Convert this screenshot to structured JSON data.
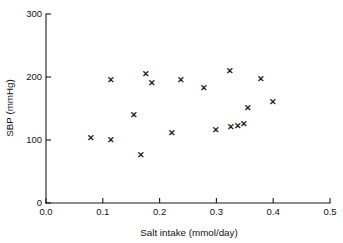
{
  "chart_data": {
    "type": "scatter",
    "title": "",
    "xlabel": "Salt intake  (mmol/day)",
    "ylabel": "SBP (mmHg)",
    "xlim": [
      0.0,
      0.5
    ],
    "ylim": [
      0,
      300
    ],
    "xticks": [
      "0.0",
      "0.1",
      "0.2",
      "0.3",
      "0.4",
      "0.5"
    ],
    "xtick_values": [
      0.0,
      0.1,
      0.2,
      0.3,
      0.4,
      0.5
    ],
    "yticks": [
      "0",
      "100",
      "200",
      "300"
    ],
    "ytick_values": [
      0,
      100,
      200,
      300
    ],
    "grid": false,
    "legend": "none",
    "marker": "x",
    "marker_color": "#1a1a1a",
    "series": [
      {
        "name": "subjects",
        "points": [
          {
            "x": 0.079,
            "y": 103
          },
          {
            "x": 0.114,
            "y": 195
          },
          {
            "x": 0.114,
            "y": 100
          },
          {
            "x": 0.155,
            "y": 140
          },
          {
            "x": 0.167,
            "y": 76
          },
          {
            "x": 0.176,
            "y": 205
          },
          {
            "x": 0.186,
            "y": 190
          },
          {
            "x": 0.221,
            "y": 111
          },
          {
            "x": 0.238,
            "y": 196
          },
          {
            "x": 0.279,
            "y": 183
          },
          {
            "x": 0.299,
            "y": 116
          },
          {
            "x": 0.324,
            "y": 210
          },
          {
            "x": 0.326,
            "y": 121
          },
          {
            "x": 0.348,
            "y": 126
          },
          {
            "x": 0.355,
            "y": 151
          },
          {
            "x": 0.378,
            "y": 197
          },
          {
            "x": 0.399,
            "y": 161
          },
          {
            "x": 0.338,
            "y": 123
          }
        ]
      }
    ]
  },
  "figure": {
    "background_color": "#ffffff",
    "axis_color": "#1a1a1a"
  }
}
